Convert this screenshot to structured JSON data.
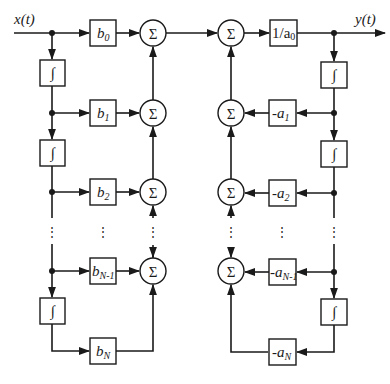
{
  "diagram": {
    "title": "",
    "input_label": "x(t)",
    "output_label": "y(t)",
    "integrator_symbol": "∫",
    "sum_symbol": "Σ",
    "ellipsis": "⋮",
    "gain_output": {
      "text": "1/a",
      "sub": "0"
    },
    "feedforward_gains": [
      {
        "text": "b",
        "sub": "0"
      },
      {
        "text": "b",
        "sub": "1"
      },
      {
        "text": "b",
        "sub": "2"
      },
      {
        "text": "b",
        "sub": "N-1"
      },
      {
        "text": "b",
        "sub": "N"
      }
    ],
    "feedback_gains": [
      {
        "text": "-a",
        "sub": "1"
      },
      {
        "text": "-a",
        "sub": "2"
      },
      {
        "text": "-a",
        "sub": "N-1"
      },
      {
        "text": "-a",
        "sub": "N"
      }
    ],
    "colors": {
      "stroke": "#1a1a1a",
      "background": "#ffffff"
    }
  }
}
